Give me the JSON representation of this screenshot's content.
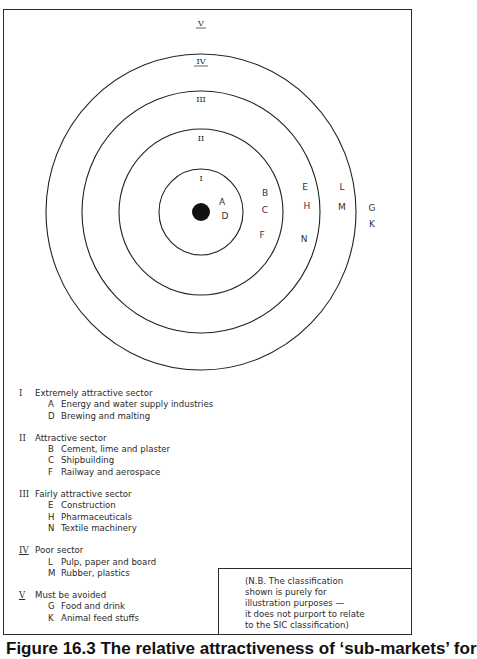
{
  "diagram": {
    "rings": [
      {
        "label": "I",
        "rx": 42,
        "ry": 43
      },
      {
        "label": "II",
        "rx": 82,
        "ry": 83
      },
      {
        "label": "III",
        "rx": 119,
        "ry": 121
      },
      {
        "label": "IV",
        "rx": 155,
        "ry": 158
      }
    ],
    "outer_label": "V",
    "center": {
      "x": 201,
      "y": 212,
      "dot_radius": 9
    },
    "ring_labels": {
      "I": "I",
      "II": "II",
      "III": "III",
      "IV": "IV",
      "V": "V"
    },
    "points": [
      {
        "code": "A",
        "x": 222,
        "y": 205
      },
      {
        "code": "D",
        "x": 225,
        "y": 219
      },
      {
        "code": "B",
        "x": 265,
        "y": 196
      },
      {
        "code": "C",
        "x": 265,
        "y": 213
      },
      {
        "code": "F",
        "x": 262,
        "y": 238
      },
      {
        "code": "E",
        "x": 305,
        "y": 190
      },
      {
        "code": "H",
        "x": 307,
        "y": 209
      },
      {
        "code": "N",
        "x": 304,
        "y": 242
      },
      {
        "code": "L",
        "x": 342,
        "y": 190
      },
      {
        "code": "M",
        "x": 342,
        "y": 210
      },
      {
        "code": "G",
        "x": 372,
        "y": 211
      },
      {
        "code": "K",
        "x": 372,
        "y": 227
      }
    ]
  },
  "legend": [
    {
      "numeral": "I",
      "title": "Extremely attractive sector",
      "items": [
        {
          "code": "A",
          "label": "Energy and water supply industries"
        },
        {
          "code": "D",
          "label": "Brewing and malting"
        }
      ]
    },
    {
      "numeral": "II",
      "title": "Attractive sector",
      "items": [
        {
          "code": "B",
          "label": "Cement, lime and plaster"
        },
        {
          "code": "C",
          "label": "Shipbuilding"
        },
        {
          "code": "F",
          "label": "Railway and aerospace"
        }
      ]
    },
    {
      "numeral": "III",
      "title": "Fairly attractive sector",
      "items": [
        {
          "code": "E",
          "label": "Construction"
        },
        {
          "code": "H",
          "label": "Pharmaceuticals"
        },
        {
          "code": "N",
          "label": "Textile machinery"
        }
      ]
    },
    {
      "numeral": "IV",
      "title": "Poor sector",
      "items": [
        {
          "code": "L",
          "label": "Pulp, paper and board"
        },
        {
          "code": "M",
          "label": "Rubber, plastics"
        }
      ]
    },
    {
      "numeral": "V",
      "title": "Must be avoided",
      "items": [
        {
          "code": "G",
          "label": "Food and drink"
        },
        {
          "code": "K",
          "label": "Animal feed stuffs"
        }
      ]
    }
  ],
  "note": {
    "lines": [
      "(N.B. The classification",
      "shown is purely for",
      "illustration purposes —",
      "it does not purport to relate",
      "to the SIC classification)"
    ]
  },
  "caption": "Figure 16.3   The relative attractiveness of ‘sub-markets’ for"
}
